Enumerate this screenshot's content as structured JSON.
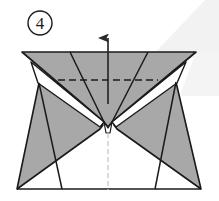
{
  "figure": {
    "kind": "origami-step-diagram",
    "step_number": "4",
    "step_badge_shape": "circle",
    "width": 219,
    "height": 201,
    "background_color": "#ffffff",
    "paper_back_color": "#a8a8a8",
    "paper_front_color": "#ffffff",
    "outline_color": "#1a1a1a",
    "fold_line_color": "#1a1a1a",
    "fold_line_style": "dashed",
    "arrow_color": "#2a2a2a",
    "center_axis_color": "#c9c9c9",
    "shadow_color": "#f0f0f0"
  },
  "annotations": {
    "step_label": "4",
    "arrow_label": "fold-up-arrow",
    "fold_line_label": "valley-fold-dashed-line",
    "axis_label": "center-axis-line"
  },
  "geometry": {
    "top_edge": {
      "left_x": 22,
      "right_x": 196,
      "y": 52
    },
    "apex": {
      "x": 108,
      "y": 124
    },
    "dashed_line": {
      "x1": 58,
      "x2": 158,
      "y": 80
    },
    "arrow": {
      "x": 108,
      "y_tip": 27,
      "y_tail": 104
    },
    "bottom_edge": {
      "left_x": 17,
      "right_x": 201,
      "y": 189
    }
  }
}
